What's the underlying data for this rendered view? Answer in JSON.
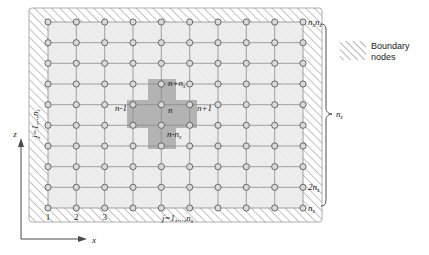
{
  "figure": {
    "title_present": false,
    "grid": {
      "columns": 10,
      "rows": 10,
      "node_count": 100
    },
    "axes": {
      "x_label": "x",
      "z_label": "z"
    },
    "labels": {
      "corner_top_right": "n",
      "corner_top_right_sub1": "x",
      "corner_top_right_2": "n",
      "corner_top_right_sub2": "z",
      "bottom_first": "1",
      "bottom_second": "2",
      "bottom_third": "3",
      "bottom_index_prefix": "j",
      "bottom_index": "=1,...,n",
      "bottom_index_sub": "x",
      "left_index_prefix": "j",
      "left_index": "=1,..,n",
      "left_index_sub": "z",
      "right_bracket": "n",
      "right_bracket_sub": "z",
      "bottom_right_nx": "n",
      "bottom_right_nx_sub": "x",
      "bottom_right_2nx": "2n",
      "bottom_right_2nx_sub": "x"
    },
    "stencil": {
      "center": "n",
      "left": "n-1",
      "right": "n+1",
      "up": "n+n",
      "up_sub": "x",
      "down": "n-n",
      "down_sub": "x"
    },
    "legend": {
      "line1": "Boundary",
      "line2": "nodes"
    },
    "colors": {
      "hatch_line": "#8f8f8f",
      "interior_fill": "#ebebeb",
      "stencil_fill": "#a8a8a8",
      "grid_line": "#8a8a8a",
      "node_fill": "#d9d9d9",
      "node_stroke": "#555555",
      "text": "#1a1a1a",
      "background": "#ffffff"
    }
  }
}
